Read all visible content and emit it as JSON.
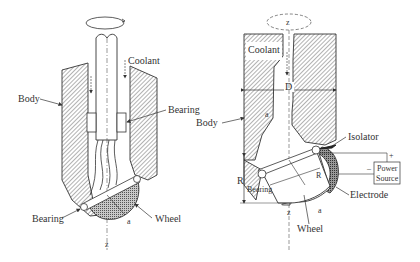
{
  "left_diagram": {
    "labels": {
      "coolant": "Coolant",
      "body": "Body",
      "bearing_top": "Bearing",
      "bearing_bottom": "Bearing",
      "wheel": "Wheel",
      "a": "a",
      "z": "z"
    }
  },
  "right_diagram": {
    "labels": {
      "z_top": "z",
      "coolant": "Coolant",
      "D": "D",
      "body": "Body",
      "a_top": "a",
      "isolator": "Isolator",
      "power_source_line1": "Power",
      "power_source_line2": "Source",
      "plus": "+",
      "minus": "–",
      "R_left": "R",
      "R_inner": "R",
      "bearing": "Bearing",
      "electrode": "Electrode",
      "z_bottom": "z",
      "a_bottom": "a",
      "wheel": "Wheel"
    }
  },
  "colors": {
    "line": "#333333",
    "hatch": "#555555",
    "wheel_fill": "#9a9a9a",
    "electrode_fill": "#7a7a7a",
    "background": "#ffffff"
  }
}
